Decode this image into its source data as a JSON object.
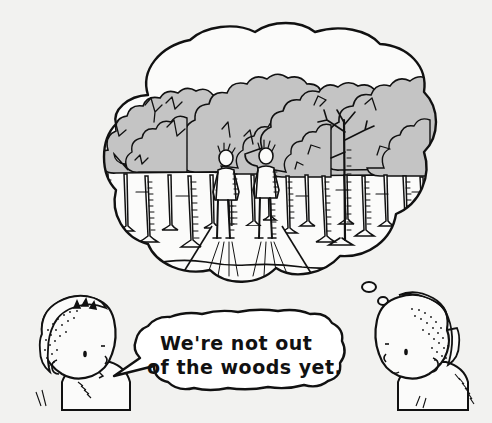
{
  "cartoon": {
    "medium": "pen-and-ink line drawing with gray wash",
    "background_color": "#f2f2f0",
    "ink_color": "#111111",
    "canopy_fill_color": "#c4c4c4",
    "paper_color": "#fbfbfa",
    "speech_bubble": {
      "name": "speech-bubble",
      "fill": "#ffffff",
      "tail_direction": "left",
      "lines": [
        "We're not out",
        "of the woods yet."
      ],
      "full_text": "We're not out of the woods yet."
    },
    "thought_bubble": {
      "name": "thought-bubble",
      "fill": "#fbfbfa",
      "tail_direction": "right",
      "dot_count": 2,
      "scene_label": "forest-scene"
    },
    "characters": [
      {
        "name": "left-character",
        "facing": "right",
        "hair": "short curly stippled hair",
        "role": "speaker"
      },
      {
        "name": "right-character",
        "facing": "left",
        "hair": "short curly stippled hair",
        "role": "thinker"
      }
    ],
    "scene_elements": [
      {
        "name": "tree-canopy-cluster-left",
        "count": 5
      },
      {
        "name": "tree-canopy-cluster-right",
        "count": 5
      },
      {
        "name": "tree-trunk-row",
        "count": 22
      },
      {
        "name": "bare-branch-tree",
        "count": 1
      },
      {
        "name": "forest-path",
        "count": 1
      },
      {
        "name": "walking-figure",
        "count": 2
      },
      {
        "name": "cast-shadow",
        "count": 2
      }
    ]
  }
}
